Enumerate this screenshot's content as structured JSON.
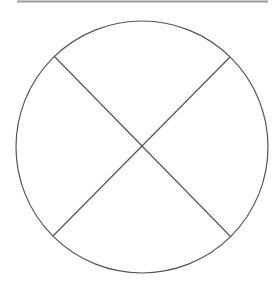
{
  "diagram": {
    "type": "circle-divided-by-diagonals",
    "background": "#ffffff",
    "top_rule": {
      "x1": 17,
      "y1": 1.5,
      "x2": 268,
      "y2": 1.5,
      "color": "#9a9a9a",
      "width": 2
    },
    "circle": {
      "cx": 142,
      "cy": 147,
      "r": 126,
      "stroke": "#555555",
      "stroke_width": 1.2
    },
    "lines": [
      {
        "name": "diagonal-top-left-to-bottom-right",
        "x1": 54,
        "y1": 56,
        "x2": 231,
        "y2": 237
      },
      {
        "name": "diagonal-top-right-to-bottom-left",
        "x1": 230,
        "y1": 57,
        "x2": 53,
        "y2": 236
      }
    ],
    "line_color": "#555555",
    "line_width": 1.2
  }
}
